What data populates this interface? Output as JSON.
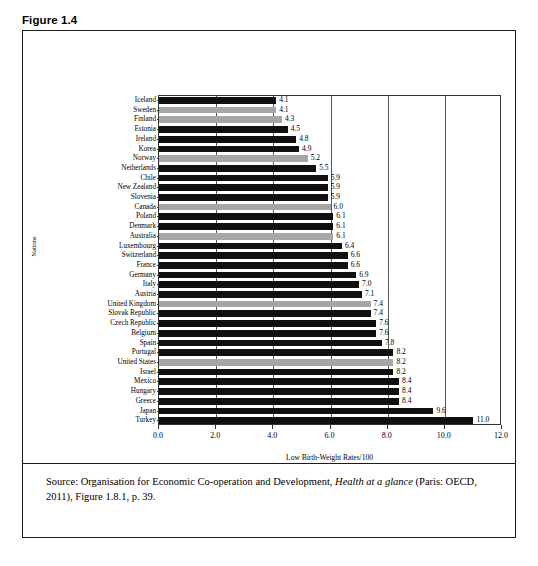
{
  "figure": {
    "number_line": "Figure 1.4",
    "title_line": "Low Birth-Weight Rates, OECD Nations, 2009",
    "source_prefix": "Source: Organisation for Economic Co-operation and Development, ",
    "source_italic": "Health at a glance",
    "source_suffix": " (Paris: OECD, 2011), Figure 1.8.1, p. 39."
  },
  "colors": {
    "bar_dark": "#101010",
    "bar_light": "#a6a6a6",
    "border": "#1a1a1a",
    "background": "#ffffff"
  },
  "chart_data": {
    "type": "bar",
    "orientation": "horizontal",
    "title": "Low Birth-Weight Rates, OECD Nations, 2009",
    "xlabel": "Low Birth-Weight Rates/100",
    "ylabel": "Nations",
    "xlim": [
      0.0,
      12.0
    ],
    "xticks": [
      "0.0",
      "2.0",
      "4.0",
      "6.0",
      "8.0",
      "10.0",
      "12.0"
    ],
    "xtick_values": [
      0.0,
      2.0,
      4.0,
      6.0,
      8.0,
      10.0,
      12.0
    ],
    "grid": true,
    "grid_axis": "x",
    "legend": null,
    "categories": [
      "Iceland",
      "Sweden",
      "Finland",
      "Estonia",
      "Ireland",
      "Korea",
      "Norway",
      "Netherlands",
      "Chile",
      "New Zealand",
      "Slovenia",
      "Canada",
      "Poland",
      "Denmark",
      "Australia",
      "Luxembourg",
      "Switzerland",
      "France",
      "Germany",
      "Italy",
      "Austria",
      "United Kingdom",
      "Slovak Republic",
      "Czech Republic",
      "Belgium",
      "Spain",
      "Portugal",
      "United States",
      "Israel",
      "Mexico",
      "Hungary",
      "Greece",
      "Japan",
      "Turkey"
    ],
    "values": [
      4.1,
      4.1,
      4.3,
      4.5,
      4.8,
      4.9,
      5.2,
      5.5,
      5.9,
      5.9,
      5.9,
      6.0,
      6.1,
      6.1,
      6.1,
      6.4,
      6.6,
      6.6,
      6.9,
      7.0,
      7.1,
      7.4,
      7.4,
      7.6,
      7.6,
      7.8,
      8.2,
      8.2,
      8.2,
      8.4,
      8.4,
      8.4,
      9.6,
      11.0
    ],
    "value_labels": [
      "4.1",
      "4.1",
      "4.3",
      "4.5",
      "4.8",
      "4.9",
      "5.2",
      "5.5",
      "5.9",
      "5.9",
      "5.9",
      "6.0",
      "6.1",
      "6.1",
      "6.1",
      "6.4",
      "6.6",
      "6.6",
      "6.9",
      "7.0",
      "7.1",
      "7.4",
      "7.4",
      "7.6",
      "7.6",
      "7.8",
      "8.2",
      "8.2",
      "8.2",
      "8.4",
      "8.4",
      "8.4",
      "9.6",
      "11.0"
    ],
    "bar_shades": [
      "dark",
      "light",
      "light",
      "dark",
      "dark",
      "dark",
      "light",
      "dark",
      "dark",
      "dark",
      "dark",
      "light",
      "dark",
      "dark",
      "light",
      "dark",
      "dark",
      "dark",
      "dark",
      "dark",
      "dark",
      "light",
      "dark",
      "dark",
      "dark",
      "dark",
      "dark",
      "light",
      "dark",
      "dark",
      "dark",
      "dark",
      "dark",
      "dark"
    ]
  }
}
